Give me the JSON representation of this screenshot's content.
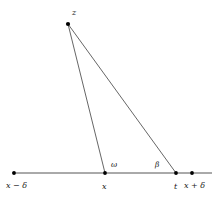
{
  "figure": {
    "type": "geometry-diagram",
    "background_color": "#ffffff",
    "line_color": "#555555",
    "point_color": "#000000",
    "text_color": "#1a1a1a",
    "points": [
      {
        "id": "z",
        "label": "z",
        "x": 68,
        "y": 24,
        "label_x": 72,
        "label_y": 9,
        "kind": "apex"
      },
      {
        "id": "x_minus",
        "label": "x − δ",
        "x": 14,
        "y": 173,
        "label_x": 6,
        "label_y": 182,
        "kind": "axis-end"
      },
      {
        "id": "x",
        "label": "x",
        "x": 105,
        "y": 173,
        "label_x": 102,
        "label_y": 183,
        "kind": "axis-vertex"
      },
      {
        "id": "t",
        "label": "t",
        "x": 176,
        "y": 173,
        "label_x": 174,
        "label_y": 183,
        "kind": "axis-vertex"
      },
      {
        "id": "x_plus",
        "label": "x + δ",
        "x": 192,
        "y": 173,
        "label_x": 184,
        "label_y": 182,
        "kind": "axis-end"
      }
    ],
    "angles": [
      {
        "id": "omega",
        "label": "ω",
        "at": "x",
        "label_x": 111,
        "label_y": 161
      },
      {
        "id": "beta",
        "label": "β",
        "at": "t",
        "label_x": 155,
        "label_y": 161
      }
    ],
    "segments": [
      {
        "id": "axis",
        "from_x": 12,
        "from_y": 173,
        "to_x": 212,
        "to_y": 173
      },
      {
        "id": "z-to-x",
        "from_x": 68,
        "from_y": 24,
        "to_x": 105,
        "to_y": 173
      },
      {
        "id": "z-to-t",
        "from_x": 68,
        "from_y": 24,
        "to_x": 176,
        "to_y": 173
      }
    ]
  }
}
